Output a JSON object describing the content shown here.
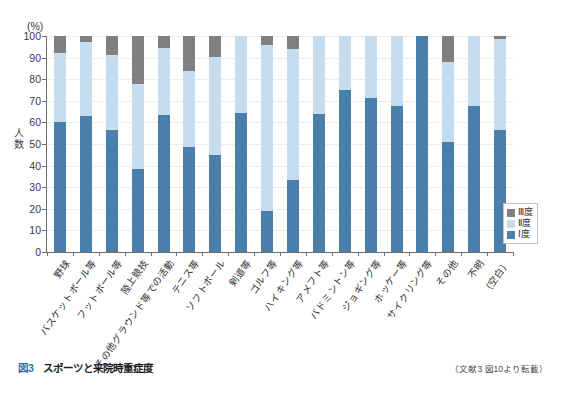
{
  "chart_data": {
    "type": "bar",
    "subtype": "stacked-percentage",
    "title": "スポーツと来院時重症度",
    "xlabel": "",
    "ylabel": "人数",
    "unit_label": "(%)",
    "ylim": [
      0,
      100
    ],
    "ytick_values": [
      0,
      10,
      20,
      30,
      40,
      50,
      60,
      70,
      80,
      90,
      100
    ],
    "ytick_labels": [
      "0",
      "10",
      "20",
      "30",
      "40",
      "50",
      "60",
      "70",
      "80",
      "90",
      "100"
    ],
    "grid": true,
    "legend_position": "bottom-right",
    "categories": [
      "野球",
      "バスケットボール等",
      "フットボール等",
      "陸上競技",
      "その他グラウンド等での活動",
      "テニス等",
      "ソフトボール",
      "剣道等",
      "ゴルフ等",
      "ハイキング等",
      "アメフト等",
      "バドミントン等",
      "ジョギング等",
      "ホッケー等",
      "サイクリング等",
      "その他",
      "不明",
      "（空白）"
    ],
    "series": [
      {
        "name": "Ⅰ度",
        "color": "#4a7fab",
        "values": [
          60,
          63,
          56.5,
          38.5,
          63.5,
          48.5,
          45,
          64.5,
          19,
          33.5,
          64,
          75,
          71.5,
          67.5,
          100,
          51,
          67.5,
          56.5
        ]
      },
      {
        "name": "Ⅱ度",
        "color": "#c6dcef",
        "values": [
          32,
          34,
          34.5,
          39.5,
          31,
          35.5,
          45.5,
          35.5,
          77,
          60.5,
          36,
          25,
          28.5,
          32.5,
          0,
          37,
          32.5,
          42
        ]
      },
      {
        "name": "Ⅲ度",
        "color": "#808080",
        "values": [
          8,
          3,
          9,
          22,
          5.5,
          16,
          9.5,
          0,
          4,
          6,
          0,
          0,
          0,
          0,
          0,
          12,
          0,
          1.5
        ]
      }
    ],
    "series_cumulative_tops": [
      {
        "name": "Ⅰ度",
        "tops": [
          60,
          63,
          56.5,
          38.5,
          63.5,
          48.5,
          45,
          64.5,
          19,
          33.5,
          64,
          75,
          71.5,
          67.5,
          100,
          51,
          67.5,
          56.5
        ]
      },
      {
        "name": "Ⅱ度",
        "tops": [
          92,
          97,
          91,
          78,
          94.5,
          84,
          90.5,
          100,
          96,
          94,
          100,
          100,
          100,
          100,
          100,
          88,
          100,
          98.5
        ]
      },
      {
        "name": "Ⅲ度",
        "tops": [
          100,
          100,
          100,
          100,
          100,
          100,
          100,
          100,
          100,
          100,
          100,
          100,
          100,
          100,
          100,
          100,
          100,
          100
        ]
      }
    ]
  },
  "legend": {
    "items": [
      {
        "label": "Ⅲ度",
        "color": "#808080"
      },
      {
        "label": "Ⅱ度",
        "color": "#c6dcef"
      },
      {
        "label": "Ⅰ度",
        "color": "#4a7fab"
      }
    ]
  },
  "caption": {
    "figure_number": "図3",
    "title": "スポーツと来院時重症度",
    "source": "（文献3 図10より転載）"
  }
}
